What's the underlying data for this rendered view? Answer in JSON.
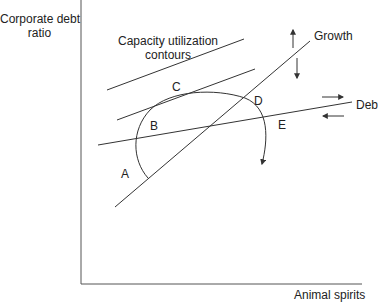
{
  "axes": {
    "y_label_line1": "Corporate debt",
    "y_label_line2": "ratio",
    "x_label": "Animal spirits"
  },
  "annotations": {
    "contours_line1": "Capacity utilization",
    "contours_line2": "contours",
    "growth": "Growth",
    "debt": "Deb",
    "points": {
      "A": "A",
      "B": "B",
      "C": "C",
      "D": "D",
      "E": "E"
    }
  },
  "colors": {
    "line": "#333333",
    "text": "#222222",
    "background": "#ffffff"
  },
  "icons": {
    "growth_up": "arrow-up-icon",
    "growth_down": "arrow-down-icon",
    "debt_right": "arrow-right-icon",
    "debt_left": "arrow-left-icon",
    "curve_end": "arrowhead-down-icon"
  }
}
